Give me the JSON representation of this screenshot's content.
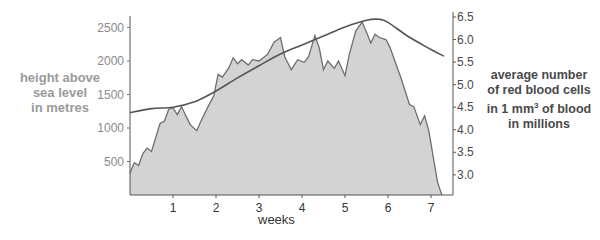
{
  "chart_data": {
    "type": "area",
    "title": "",
    "xlabel": "weeks",
    "ylabel_left": "height above sea level in metres",
    "ylabel_right_lines": [
      "average number",
      "of red blood cells",
      "in 1 mm",
      "of blood",
      "in millions"
    ],
    "xlim": [
      0,
      7.3
    ],
    "ylim_left": [
      0,
      2600
    ],
    "ylim_right": [
      2.6,
      6.5
    ],
    "x_ticks": [
      1,
      2,
      3,
      4,
      5,
      6,
      7
    ],
    "y_left_ticks": [
      500,
      1000,
      1500,
      2000,
      2500
    ],
    "y_right_ticks": [
      "3.0",
      "3.5",
      "4.0",
      "4.5",
      "5.0",
      "5.5",
      "6.0",
      "6.5"
    ],
    "grid": false,
    "series": [
      {
        "name": "height above sea level (m)",
        "axis": "left",
        "style": "filled area",
        "x": [
          0,
          0.1,
          0.2,
          0.3,
          0.4,
          0.5,
          0.6,
          0.7,
          0.8,
          0.9,
          1.0,
          1.1,
          1.2,
          1.3,
          1.4,
          1.55,
          1.65,
          1.8,
          1.95,
          2.05,
          2.15,
          2.3,
          2.4,
          2.5,
          2.6,
          2.75,
          2.85,
          3.0,
          3.1,
          3.2,
          3.35,
          3.5,
          3.6,
          3.75,
          3.9,
          4.05,
          4.15,
          4.3,
          4.4,
          4.5,
          4.6,
          4.75,
          4.85,
          5.0,
          5.1,
          5.25,
          5.4,
          5.5,
          5.6,
          5.7,
          5.8,
          5.95,
          6.05,
          6.15,
          6.3,
          6.5,
          6.6,
          6.75,
          6.85,
          6.95,
          7.05,
          7.15,
          7.25
        ],
        "values": [
          330,
          480,
          440,
          620,
          700,
          650,
          860,
          1070,
          1100,
          1280,
          1300,
          1200,
          1320,
          1180,
          1050,
          960,
          1100,
          1300,
          1480,
          1800,
          1760,
          1900,
          2050,
          1960,
          2020,
          1940,
          2020,
          2000,
          2050,
          2100,
          2280,
          2350,
          2060,
          1870,
          2020,
          1980,
          2060,
          2380,
          2200,
          1870,
          2000,
          1890,
          2000,
          1780,
          2100,
          2450,
          2580,
          2430,
          2270,
          2400,
          2350,
          2320,
          2200,
          2020,
          1750,
          1350,
          1320,
          1050,
          1180,
          950,
          580,
          200,
          0
        ]
      },
      {
        "name": "average number of red blood cells in 1 mm3 of blood (millions)",
        "axis": "right",
        "style": "line",
        "x": [
          0,
          0.5,
          1.0,
          1.5,
          2.0,
          2.5,
          3.0,
          3.5,
          4.0,
          4.5,
          5.0,
          5.5,
          5.8,
          6.0,
          6.5,
          7.0,
          7.3
        ],
        "values": [
          4.38,
          4.47,
          4.5,
          4.62,
          4.86,
          5.15,
          5.42,
          5.68,
          5.88,
          6.08,
          6.28,
          6.43,
          6.45,
          6.38,
          6.05,
          5.78,
          5.63
        ]
      }
    ]
  },
  "labels": {
    "left_axis": [
      "height above",
      "sea level",
      "in metres"
    ],
    "right_axis_line1": "average number",
    "right_axis_line2": "of red blood cells",
    "right_axis_line3a": "in 1 mm",
    "right_axis_line3sup": "3",
    "right_axis_line3b": " of blood",
    "right_axis_line4": "in millions",
    "x_axis": "weeks"
  }
}
